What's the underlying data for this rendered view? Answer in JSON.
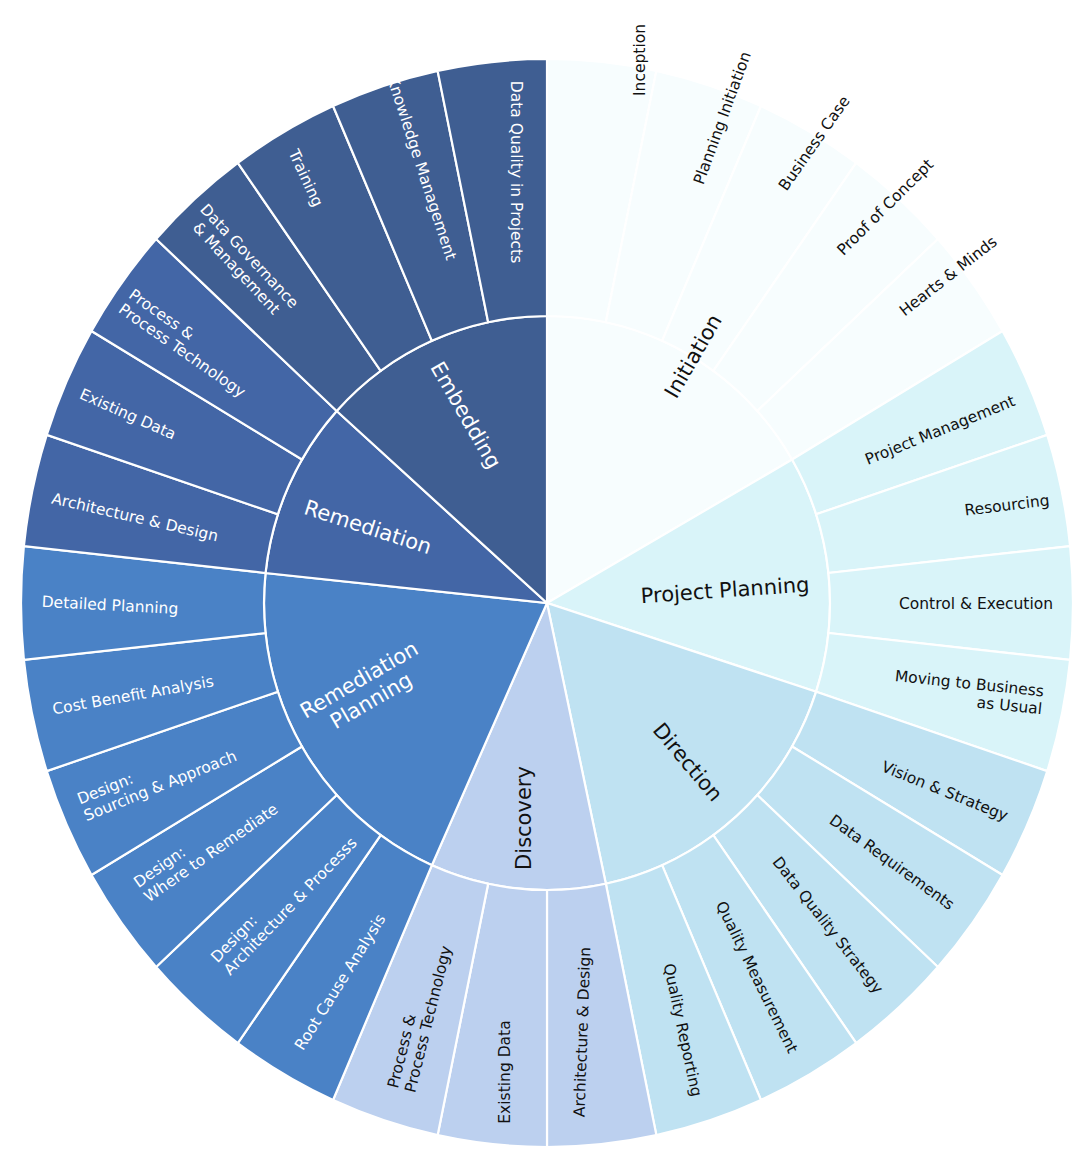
{
  "chart_data": {
    "type": "sunburst",
    "title": "",
    "center": [
      547,
      603
    ],
    "radii": {
      "inner_rx": 283,
      "inner_ry": 287,
      "outer_rx": 526,
      "outer_ry": 544
    },
    "angle_unit_deg_per_leaf": 12,
    "rings": [
      "phase",
      "activity"
    ],
    "phases": [
      {
        "name": "Initiation",
        "color": "#f7fdfe",
        "text_color": "#111111",
        "start": 30,
        "end": 90,
        "label": {
          "lines": [
            "Initiation"
          ],
          "x": 693,
          "y": 356,
          "rot": -60
        },
        "children": [
          {
            "name": "Inception",
            "lines": [
              "Inception"
            ],
            "x": 640,
            "y": 60,
            "rot": -90,
            "anchor": "middle"
          },
          {
            "name": "Planning Initiation",
            "lines": [
              "Planning Initiation"
            ],
            "x": 722,
            "y": 118,
            "rot": -70,
            "anchor": "middle"
          },
          {
            "name": "Business Case",
            "lines": [
              "Business Case"
            ],
            "x": 814,
            "y": 143,
            "rot": -55,
            "anchor": "middle"
          },
          {
            "name": "Proof of Concept",
            "lines": [
              "Proof of Concept"
            ],
            "x": 885,
            "y": 207,
            "rot": -45,
            "anchor": "middle"
          },
          {
            "name": "Hearts & Minds",
            "lines": [
              "Hearts & Minds"
            ],
            "x": 948,
            "y": 276,
            "rot": -38,
            "anchor": "middle"
          }
        ]
      },
      {
        "name": "Project Planning",
        "color": "#d9f4f9",
        "text_color": "#111111",
        "start": -18,
        "end": 30,
        "label": {
          "lines": [
            "Project Planning"
          ],
          "x": 725,
          "y": 590,
          "rot": -4
        },
        "children": [
          {
            "name": "Project Management",
            "lines": [
              "Project Management"
            ],
            "x": 940,
            "y": 430,
            "rot": -22,
            "anchor": "middle"
          },
          {
            "name": "Resourcing",
            "lines": [
              "Resourcing"
            ],
            "x": 1007,
            "y": 505,
            "rot": -7,
            "anchor": "middle"
          },
          {
            "name": "Control & Execution",
            "lines": [
              "Control & Execution"
            ],
            "x": 976,
            "y": 604,
            "rot": 0,
            "anchor": "middle"
          },
          {
            "name": "Moving to Business as Usual",
            "lines": [
              "Moving to Business",
              "as Usual"
            ],
            "x": 1043,
            "y": 700,
            "rot": 6,
            "anchor": "end"
          }
        ]
      },
      {
        "name": "Direction",
        "color": "#bfe2f2",
        "text_color": "#111111",
        "start": -78,
        "end": -18,
        "label": {
          "lines": [
            "Direction"
          ],
          "x": 688,
          "y": 762,
          "rot": 50
        },
        "children": [
          {
            "name": "Vision & Strategy",
            "lines": [
              "Vision & Strategy"
            ],
            "x": 945,
            "y": 791,
            "rot": 22,
            "anchor": "middle"
          },
          {
            "name": "Data Requirements",
            "lines": [
              "Data Requirements"
            ],
            "x": 892,
            "y": 862,
            "rot": 36,
            "anchor": "middle"
          },
          {
            "name": "Data Quality Strategy",
            "lines": [
              "Data Quality Strategy"
            ],
            "x": 828,
            "y": 925,
            "rot": 52,
            "anchor": "middle"
          },
          {
            "name": "Quality Measurement",
            "lines": [
              "Quality Measurement"
            ],
            "x": 757,
            "y": 977,
            "rot": 64,
            "anchor": "middle"
          },
          {
            "name": "Quality Reporting",
            "lines": [
              "Quality Reporting"
            ],
            "x": 683,
            "y": 1030,
            "rot": 78,
            "anchor": "middle"
          }
        ]
      },
      {
        "name": "Discovery",
        "color": "#bcd0ef",
        "text_color": "#111111",
        "start": -114,
        "end": -78,
        "label": {
          "lines": [
            "Discovery"
          ],
          "x": 524,
          "y": 818,
          "rot": -90
        },
        "children": [
          {
            "name": "Architecture & Design",
            "lines": [
              "Architecture & Design"
            ],
            "x": 582,
            "y": 1032,
            "rot": -88,
            "anchor": "middle"
          },
          {
            "name": "Existing Data",
            "lines": [
              "Existing Data"
            ],
            "x": 505,
            "y": 1072,
            "rot": -90,
            "anchor": "middle"
          },
          {
            "name": "Process & Process Technology",
            "lines": [
              "Process &",
              "Process Technology"
            ],
            "x": 418,
            "y": 1022,
            "rot": -76,
            "anchor": "start",
            "x_offset": -70
          }
        ]
      },
      {
        "name": "Remediation Planning",
        "color": "#4a82c6",
        "text_color": "#ffffff",
        "start": 174,
        "end": 246,
        "label": {
          "lines": [
            "Remediation",
            "Planning"
          ],
          "x": 365,
          "y": 690,
          "rot": -30
        },
        "children": [
          {
            "name": "Root Cause Analysis",
            "lines": [
              "Root Cause Analysis"
            ],
            "x": 340,
            "y": 982,
            "rot": -58,
            "anchor": "middle"
          },
          {
            "name": "Design: Architecture & Processs",
            "lines": [
              "Design:",
              "Architecture & Processs"
            ],
            "x": 272,
            "y": 912,
            "rot": -46,
            "anchor": "start",
            "x_offset": -75
          },
          {
            "name": "Design: Where to Remediate",
            "lines": [
              "Design:",
              "Where to Remediate"
            ],
            "x": 202,
            "y": 848,
            "rot": -35,
            "anchor": "start",
            "x_offset": -75
          },
          {
            "name": "Design: Sourcing & Approach",
            "lines": [
              "Design:",
              "Sourcing & Approach"
            ],
            "x": 160,
            "y": 776,
            "rot": -22,
            "anchor": "start",
            "x_offset": -85
          },
          {
            "name": "Cost Benefit Analysis",
            "lines": [
              "Cost Benefit Analysis"
            ],
            "x": 133,
            "y": 695,
            "rot": -10,
            "anchor": "middle"
          },
          {
            "name": "Detailed Planning",
            "lines": [
              "Detailed Planning"
            ],
            "x": 110,
            "y": 605,
            "rot": 3,
            "anchor": "middle"
          }
        ]
      },
      {
        "name": "Remediation",
        "color": "#4366a6",
        "text_color": "#ffffff",
        "start": 138,
        "end": 174,
        "label": {
          "lines": [
            "Remediation"
          ],
          "x": 368,
          "y": 527,
          "rot": 18
        },
        "children": [
          {
            "name": "Architecture & Design",
            "lines": [
              "Architecture & Design"
            ],
            "x": 135,
            "y": 517,
            "rot": 13,
            "anchor": "middle"
          },
          {
            "name": "Existing Data",
            "lines": [
              "Existing Data"
            ],
            "x": 128,
            "y": 414,
            "rot": 24,
            "anchor": "middle"
          },
          {
            "name": "Process & Process Technology",
            "lines": [
              "Process &",
              "Process Technology"
            ],
            "x": 183,
            "y": 340,
            "rot": 35,
            "anchor": "start",
            "x_offset": -70
          }
        ]
      },
      {
        "name": "Embedding",
        "color": "#3f5e92",
        "text_color": "#ffffff",
        "start": 90,
        "end": 138,
        "label": {
          "lines": [
            "Embedding"
          ],
          "x": 466,
          "y": 415,
          "rot": 60
        },
        "children": [
          {
            "name": "Data Governance & Management",
            "lines": [
              "Data Governance",
              "& Management"
            ],
            "x": 243,
            "y": 262,
            "rot": 47,
            "anchor": "middle"
          },
          {
            "name": "Training",
            "lines": [
              "Training"
            ],
            "x": 306,
            "y": 178,
            "rot": 65,
            "anchor": "middle"
          },
          {
            "name": "Knowledge Management",
            "lines": [
              "Knowledge Management"
            ],
            "x": 422,
            "y": 168,
            "rot": 72,
            "anchor": "middle"
          },
          {
            "name": "Data Quality in Projects",
            "lines": [
              "Data Quality in Projects"
            ],
            "x": 516,
            "y": 172,
            "rot": 90,
            "anchor": "middle"
          }
        ]
      }
    ]
  }
}
